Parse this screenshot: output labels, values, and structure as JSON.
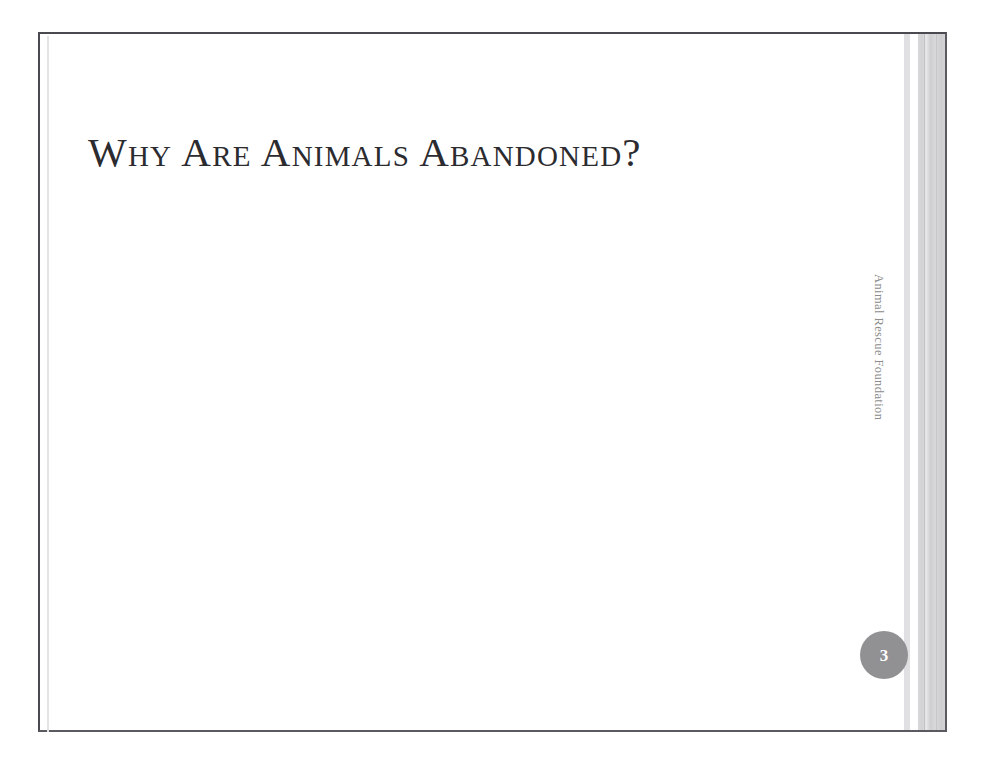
{
  "document": {
    "type": "presentation-slide",
    "background_color": "#ffffff"
  },
  "slide": {
    "title": "Why Are Animals Abandoned?",
    "body_text": "",
    "side_label": "Animal Rescue Foundation",
    "page_number": "3",
    "colors": {
      "title_text": "#2b2b30",
      "side_label_text": "#8c8c8c",
      "badge_fill": "#919194",
      "badge_text": "#ffffff",
      "frame_border": "#4a4a50",
      "stripe_light": "#e0e0e2",
      "stripe_gray": "#d4d4d7"
    }
  }
}
